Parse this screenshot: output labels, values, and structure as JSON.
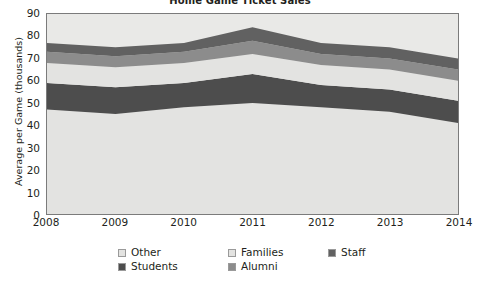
{
  "chart_data": {
    "type": "area",
    "stacked": true,
    "title": "Home Game Ticket Sales",
    "xlabel": "",
    "ylabel": "Average per Game (thousands)",
    "categories": [
      "2008",
      "2009",
      "2010",
      "2011",
      "2012",
      "2013",
      "2014"
    ],
    "x": [
      2008,
      2009,
      2010,
      2011,
      2012,
      2013,
      2014
    ],
    "ylim": [
      0,
      90
    ],
    "yticks": [
      0,
      10,
      20,
      30,
      40,
      50,
      60,
      70,
      80,
      90
    ],
    "grid": false,
    "legend_position": "bottom",
    "series": [
      {
        "name": "Other",
        "color": "#e3e3e1",
        "values": [
          47,
          45,
          48,
          50,
          48,
          46,
          41
        ]
      },
      {
        "name": "Students",
        "color": "#4d4d4d",
        "values": [
          12,
          12,
          11,
          13,
          10,
          10,
          10
        ]
      },
      {
        "name": "Families",
        "color": "#e3e3e1",
        "values": [
          9,
          9,
          9,
          9,
          9,
          9,
          9
        ]
      },
      {
        "name": "Alumni",
        "color": "#8c8c8c",
        "values": [
          5,
          5,
          5,
          6,
          5,
          5,
          5
        ]
      },
      {
        "name": "Staff",
        "color": "#616161",
        "values": [
          4,
          4,
          4,
          6,
          5,
          5,
          5
        ]
      }
    ],
    "cumulative_tops": {
      "Other": [
        47,
        45,
        48,
        50,
        48,
        46,
        41
      ],
      "Students": [
        59,
        57,
        59,
        63,
        58,
        56,
        51
      ],
      "Families": [
        68,
        66,
        68,
        72,
        67,
        65,
        60
      ],
      "Alumni": [
        73,
        71,
        73,
        78,
        72,
        70,
        65
      ],
      "Staff": [
        77,
        75,
        77,
        84,
        77,
        75,
        70
      ]
    }
  },
  "legend": {
    "items": [
      {
        "label": "Other",
        "swatch": "#e3e3e1"
      },
      {
        "label": "Families",
        "swatch": "#e3e3e1"
      },
      {
        "label": "Staff",
        "swatch": "#616161"
      },
      {
        "label": "Students",
        "swatch": "#4d4d4d"
      },
      {
        "label": "Alumni",
        "swatch": "#8c8c8c"
      }
    ]
  },
  "axes": {
    "y_title": "Average per Game (thousands)",
    "y_labels": [
      "90",
      "80",
      "70",
      "60",
      "50",
      "40",
      "30",
      "20",
      "10",
      "0"
    ],
    "x_labels": [
      "2008",
      "2009",
      "2010",
      "2011",
      "2012",
      "2013",
      "2014"
    ]
  },
  "colors": {
    "plot_background": "#e9e9e7",
    "frame": "#7b7b7b",
    "text": "#231f20",
    "page_background": "#ffffff"
  }
}
